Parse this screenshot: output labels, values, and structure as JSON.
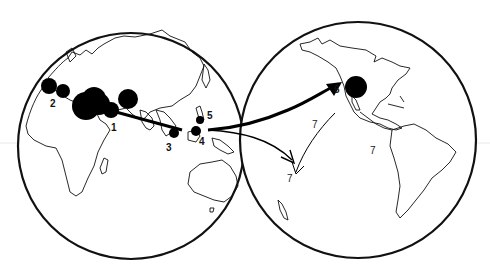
{
  "figure": {
    "background": "#ffffff",
    "ink_color": "#000000"
  },
  "globes": [
    {
      "name": "eastern-hemisphere",
      "regions_shown": [
        "Europe",
        "Africa",
        "Asia",
        "Australia"
      ]
    },
    {
      "name": "western-hemisphere",
      "regions_shown": [
        "North America",
        "South America"
      ]
    }
  ],
  "sites": [
    {
      "id": "1",
      "label": "1"
    },
    {
      "id": "2",
      "label": "2"
    },
    {
      "id": "3",
      "label": "3"
    },
    {
      "id": "4",
      "label": "4"
    },
    {
      "id": "5",
      "label": "5"
    },
    {
      "id": "6",
      "label": "6"
    }
  ],
  "route_labels": [
    {
      "id": "7a",
      "label": "7"
    },
    {
      "id": "7b",
      "label": "7"
    },
    {
      "id": "7c",
      "label": "7"
    }
  ]
}
